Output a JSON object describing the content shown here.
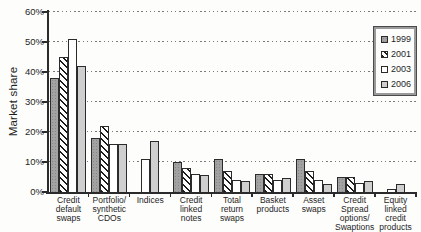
{
  "chart_data": {
    "type": "bar",
    "ylabel": "Market share",
    "ylim": [
      0,
      60
    ],
    "yticks": [
      0,
      10,
      20,
      30,
      40,
      50,
      60
    ],
    "ytick_suffix": "%",
    "grid": "horizontal-dotted",
    "legend_position": "top-right",
    "legend_items": [
      "1999",
      "2001",
      "2003",
      "2006"
    ],
    "categories": [
      "Credit default swaps",
      "Portfolio/ synthetic CDOs",
      "Indices",
      "Credit linked notes",
      "Total return swaps",
      "Basket products",
      "Asset swaps",
      "Credit Spread options/ Swaptions",
      "Equity linked credit products"
    ],
    "category_label_lines": [
      [
        "Credit",
        "default",
        "swaps"
      ],
      [
        "Portfolio/",
        "synthetic",
        "CDOs"
      ],
      [
        "Indices"
      ],
      [
        "Credit",
        "linked",
        "notes"
      ],
      [
        "Total",
        "return",
        "swaps"
      ],
      [
        "Basket",
        "products"
      ],
      [
        "Asset",
        "swaps"
      ],
      [
        "Credit",
        "Spread",
        "options/",
        "Swaptions"
      ],
      [
        "Equity",
        "linked",
        "credit",
        "products"
      ]
    ],
    "series": [
      {
        "name": "1999",
        "fill": "gray-dotted",
        "values": [
          38,
          18,
          0,
          10,
          11,
          6,
          11,
          5,
          0
        ]
      },
      {
        "name": "2001",
        "fill": "diagonal-hatch",
        "values": [
          45,
          22,
          0,
          8,
          7,
          6,
          7,
          5,
          0
        ]
      },
      {
        "name": "2003",
        "fill": "white",
        "values": [
          51,
          16,
          11,
          6,
          4,
          4,
          4,
          3,
          1
        ]
      },
      {
        "name": "2006",
        "fill": "light-gray",
        "values": [
          42,
          16,
          17,
          5.5,
          3.5,
          4.5,
          2.5,
          3.5,
          2.5
        ]
      }
    ],
    "colors": {
      "series_1999": "#a2a2a2",
      "series_2001_hatch": "#1c1c1c",
      "series_2003": "#ffffff",
      "series_2006": "#cfcfcf",
      "bar_border": "#2b2b2b",
      "axis": "#2b2b2b",
      "gridline": "#7a7a7a",
      "text": "#1f1f1f",
      "background": "#fdfdfc"
    }
  }
}
